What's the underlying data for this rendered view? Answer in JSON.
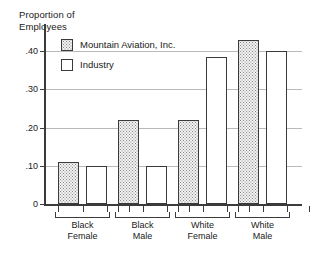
{
  "chart_data": {
    "type": "bar",
    "title": "",
    "ylabel": "Proportion of\nEmployees",
    "xlabel": "",
    "ylim": [
      0,
      0.45
    ],
    "grid": true,
    "legend_position": "upper-left-inside",
    "y_ticks": [
      {
        "value": 0,
        "label": "0"
      },
      {
        "value": 0.1,
        "label": ".10"
      },
      {
        "value": 0.2,
        "label": ".20"
      },
      {
        "value": 0.3,
        "label": ".30"
      },
      {
        "value": 0.4,
        "label": ".40"
      }
    ],
    "categories": [
      "Black\nFemale",
      "Black\nMale",
      "White\nFemale",
      "White\nMale"
    ],
    "series": [
      {
        "name": "Mountain Aviation, Inc.",
        "fill": "stippled",
        "values": [
          0.11,
          0.22,
          0.22,
          0.43
        ]
      },
      {
        "name": "Industry",
        "fill": "white",
        "values": [
          0.1,
          0.1,
          0.385,
          0.4
        ]
      }
    ]
  },
  "colors": {
    "axis": "#3b3b3b",
    "grid": "#b9b9b9",
    "bar_border": "#3a3a3a",
    "company_fill": "#f2f2f2",
    "industry_fill": "#ffffff",
    "text": "#1a1a1a"
  }
}
